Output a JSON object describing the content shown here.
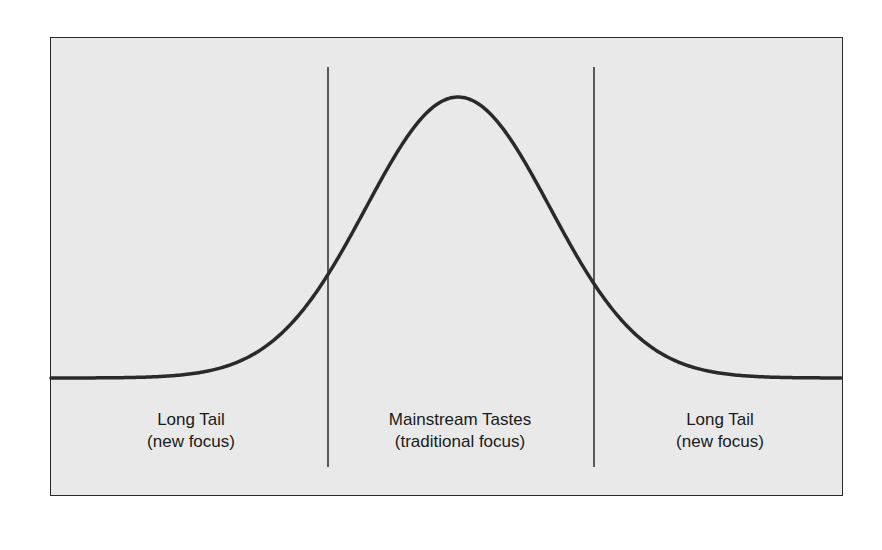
{
  "diagram": {
    "type": "bell-curve-long-tail",
    "background_color": "#e9e9e9",
    "line_color": "#2a2a2a",
    "regions": [
      {
        "id": "left-tail",
        "title": "Long Tail",
        "subtitle": "(new focus)"
      },
      {
        "id": "mainstream",
        "title": "Mainstream Tastes",
        "subtitle": "(traditional focus)"
      },
      {
        "id": "right-tail",
        "title": "Long Tail",
        "subtitle": "(new focus)"
      }
    ],
    "dividers": [
      {
        "position": "left",
        "x": 328
      },
      {
        "position": "right",
        "x": 594
      }
    ]
  },
  "chart_data": {
    "type": "line",
    "title": "",
    "xlabel": "",
    "ylabel": "",
    "curve": "gaussian",
    "regions": [
      "Long Tail (new focus)",
      "Mainstream Tastes (traditional focus)",
      "Long Tail (new focus)"
    ],
    "grid": false,
    "legend": null
  }
}
